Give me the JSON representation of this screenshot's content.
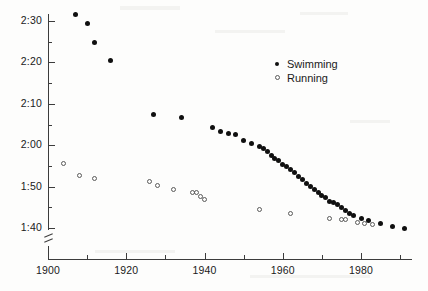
{
  "chart_data": {
    "type": "scatter",
    "title": "",
    "subtitle": "",
    "xlabel": "",
    "ylabel": "",
    "xlim": [
      1900,
      1992
    ],
    "ylim": [
      95,
      155
    ],
    "y_axis_unit": "minutes:seconds",
    "y_axis_broken_below": "1:40",
    "grid": false,
    "legend_position": "top-right",
    "x_ticks_major": [
      1900,
      1920,
      1940,
      1960,
      1980
    ],
    "x_ticks_major_labels": [
      "1900",
      "1920",
      "1940",
      "1960",
      "1980"
    ],
    "x_ticks_minor": [
      1910,
      1930,
      1950,
      1970,
      1990
    ],
    "y_ticks": [
      100,
      110,
      120,
      130,
      140,
      150
    ],
    "y_tick_labels": [
      "1:40",
      "1:50",
      "2:00",
      "2:10",
      "2:20",
      "2:30"
    ],
    "series": [
      {
        "name": "Swimming",
        "marker": "filled-circle",
        "color": "#101010",
        "points": [
          [
            1907,
            151.5
          ],
          [
            1910,
            149.5
          ],
          [
            1912,
            144.8
          ],
          [
            1916,
            140.5
          ],
          [
            1927,
            127.4
          ],
          [
            1934,
            126.8
          ],
          [
            1942,
            124.2
          ],
          [
            1944,
            123.4
          ],
          [
            1946,
            122.9
          ],
          [
            1948,
            122.6
          ],
          [
            1950,
            121.1
          ],
          [
            1952,
            120.3
          ],
          [
            1954,
            119.8
          ],
          [
            1955,
            119.3
          ],
          [
            1956,
            118.4
          ],
          [
            1957,
            117.6
          ],
          [
            1958,
            116.8
          ],
          [
            1959,
            116.2
          ],
          [
            1960,
            115.4
          ],
          [
            1961,
            114.8
          ],
          [
            1962,
            114.1
          ],
          [
            1963,
            113.3
          ],
          [
            1964,
            112.4
          ],
          [
            1965,
            111.6
          ],
          [
            1966,
            110.8
          ],
          [
            1967,
            110.1
          ],
          [
            1968,
            109.3
          ],
          [
            1969,
            108.6
          ],
          [
            1970,
            107.8
          ],
          [
            1971,
            107.3
          ],
          [
            1972,
            106.4
          ],
          [
            1973,
            106.2
          ],
          [
            1974,
            105.6
          ],
          [
            1975,
            104.9
          ],
          [
            1976,
            104.2
          ],
          [
            1977,
            103.6
          ],
          [
            1978,
            103.1
          ],
          [
            1980,
            102.4
          ],
          [
            1982,
            101.8
          ],
          [
            1985,
            101.1
          ],
          [
            1988,
            100.4
          ],
          [
            1991,
            99.8
          ]
        ]
      },
      {
        "name": "Running",
        "marker": "open-circle",
        "color": "#5a5a5a",
        "points": [
          [
            1904,
            115.6
          ],
          [
            1908,
            112.8
          ],
          [
            1912,
            112.0
          ],
          [
            1926,
            111.2
          ],
          [
            1928,
            110.2
          ],
          [
            1932,
            109.3
          ],
          [
            1937,
            108.6
          ],
          [
            1938,
            108.5
          ],
          [
            1939,
            107.6
          ],
          [
            1940,
            106.8
          ],
          [
            1954,
            104.4
          ],
          [
            1962,
            103.6
          ],
          [
            1972,
            102.4
          ],
          [
            1975,
            102.1
          ],
          [
            1976,
            102.0
          ],
          [
            1979,
            101.4
          ],
          [
            1981,
            101.0
          ],
          [
            1983,
            100.9
          ]
        ]
      }
    ]
  },
  "legend": {
    "items": [
      {
        "label": "Swimming",
        "marker": "filled-circle"
      },
      {
        "label": "Running",
        "marker": "open-circle"
      }
    ]
  },
  "axis": {
    "break_symbol": "axis-break-slash"
  }
}
